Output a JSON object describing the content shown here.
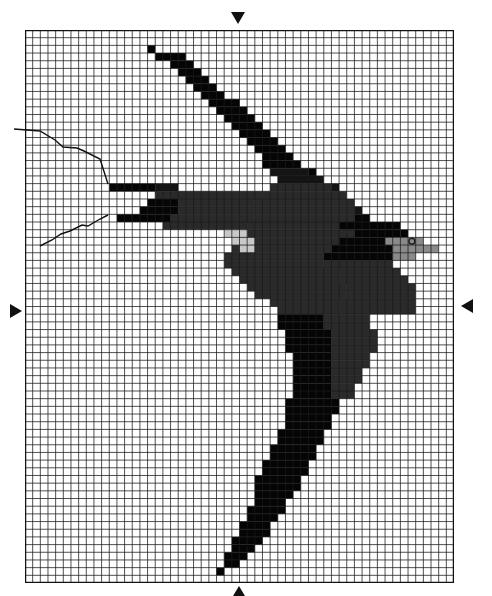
{
  "chart_title": "",
  "grid": {
    "cols": 56,
    "rows": 72,
    "left": 25,
    "top": 30,
    "width": 429,
    "height": 553,
    "line_color": "#1a1a1a",
    "background": "#ffffff"
  },
  "palette": {
    "K": "#050505",
    "B": "#141414",
    "D": "#2a2a2a",
    "G": "#8a8a8a",
    "L": "#c8c8c8"
  },
  "center_markers": [
    {
      "position": "top",
      "glyph": "▼"
    },
    {
      "position": "bottom",
      "glyph": "▲"
    },
    {
      "position": "left",
      "glyph": "▶"
    },
    {
      "position": "right",
      "glyph": "◀"
    }
  ],
  "eye": {
    "col": 50,
    "row": 27,
    "color": "#111111"
  },
  "tail_streamers": [
    [
      [
        14,
        129
      ],
      [
        40,
        131
      ],
      [
        55,
        140
      ],
      [
        63,
        147
      ],
      [
        77,
        148
      ],
      [
        84,
        151
      ],
      [
        100,
        159
      ],
      [
        108,
        184
      ]
    ],
    [
      [
        108,
        215
      ],
      [
        100,
        219
      ],
      [
        88,
        226
      ],
      [
        82,
        225
      ],
      [
        70,
        231
      ],
      [
        61,
        234
      ],
      [
        52,
        240
      ],
      [
        40,
        246
      ]
    ]
  ],
  "stitches": [
    {
      "row": 2,
      "runs": [
        [
          16,
          16,
          "K"
        ]
      ]
    },
    {
      "row": 3,
      "runs": [
        [
          17,
          20,
          "K"
        ]
      ]
    },
    {
      "row": 4,
      "runs": [
        [
          19,
          21,
          "K"
        ]
      ]
    },
    {
      "row": 5,
      "runs": [
        [
          20,
          22,
          "K"
        ]
      ]
    },
    {
      "row": 6,
      "runs": [
        [
          21,
          23,
          "K"
        ]
      ]
    },
    {
      "row": 7,
      "runs": [
        [
          22,
          24,
          "K"
        ]
      ]
    },
    {
      "row": 8,
      "runs": [
        [
          23,
          25,
          "K"
        ]
      ]
    },
    {
      "row": 9,
      "runs": [
        [
          24,
          27,
          "K"
        ]
      ]
    },
    {
      "row": 10,
      "runs": [
        [
          25,
          28,
          "K"
        ]
      ]
    },
    {
      "row": 11,
      "runs": [
        [
          26,
          29,
          "K"
        ]
      ]
    },
    {
      "row": 12,
      "runs": [
        [
          27,
          30,
          "K"
        ]
      ]
    },
    {
      "row": 13,
      "runs": [
        [
          28,
          31,
          "K"
        ]
      ]
    },
    {
      "row": 14,
      "runs": [
        [
          29,
          32,
          "K"
        ]
      ]
    },
    {
      "row": 15,
      "runs": [
        [
          30,
          33,
          "K"
        ]
      ]
    },
    {
      "row": 16,
      "runs": [
        [
          31,
          34,
          "K"
        ]
      ]
    },
    {
      "row": 17,
      "runs": [
        [
          31,
          35,
          "K"
        ]
      ]
    },
    {
      "row": 18,
      "runs": [
        [
          32,
          36,
          "B"
        ],
        [
          37,
          37,
          "K"
        ]
      ]
    },
    {
      "row": 19,
      "runs": [
        [
          33,
          38,
          "B"
        ]
      ]
    },
    {
      "row": 20,
      "runs": [
        [
          32,
          39,
          "D"
        ],
        [
          40,
          40,
          "B"
        ]
      ]
    },
    {
      "row": 21,
      "runs": [
        [
          31,
          41,
          "D"
        ]
      ]
    },
    {
      "row": 22,
      "runs": [
        [
          30,
          42,
          "D"
        ]
      ]
    },
    {
      "row": 23,
      "runs": [
        [
          30,
          42,
          "D"
        ],
        [
          43,
          43,
          "B"
        ]
      ]
    },
    {
      "row": 24,
      "runs": [
        [
          30,
          42,
          "D"
        ],
        [
          43,
          44,
          "K"
        ]
      ]
    },
    {
      "row": 25,
      "runs": [
        [
          29,
          40,
          "D"
        ],
        [
          41,
          46,
          "K"
        ],
        [
          47,
          48,
          "K"
        ]
      ]
    },
    {
      "row": 26,
      "runs": [
        [
          29,
          42,
          "D"
        ],
        [
          43,
          48,
          "K"
        ],
        [
          49,
          49,
          "K"
        ]
      ]
    },
    {
      "row": 27,
      "runs": [
        [
          28,
          40,
          "D"
        ],
        [
          41,
          46,
          "K"
        ],
        [
          47,
          51,
          "G"
        ]
      ]
    },
    {
      "row": 28,
      "runs": [
        [
          27,
          39,
          "D"
        ],
        [
          40,
          47,
          "K"
        ],
        [
          48,
          53,
          "G"
        ]
      ]
    },
    {
      "row": 29,
      "runs": [
        [
          26,
          38,
          "D"
        ],
        [
          39,
          47,
          "K"
        ],
        [
          48,
          50,
          "G"
        ]
      ]
    },
    {
      "row": 30,
      "runs": [
        [
          26,
          38,
          "D"
        ],
        [
          39,
          47,
          "D"
        ]
      ]
    },
    {
      "row": 31,
      "runs": [
        [
          27,
          40,
          "D"
        ],
        [
          41,
          48,
          "D"
        ]
      ]
    },
    {
      "row": 32,
      "runs": [
        [
          28,
          40,
          "D"
        ],
        [
          41,
          49,
          "D"
        ]
      ]
    },
    {
      "row": 33,
      "runs": [
        [
          29,
          41,
          "D"
        ],
        [
          42,
          50,
          "D"
        ]
      ]
    },
    {
      "row": 34,
      "runs": [
        [
          30,
          41,
          "D"
        ],
        [
          42,
          50,
          "D"
        ]
      ]
    },
    {
      "row": 35,
      "runs": [
        [
          32,
          40,
          "D"
        ],
        [
          41,
          50,
          "D"
        ]
      ]
    },
    {
      "row": 36,
      "runs": [
        [
          33,
          40,
          "D"
        ],
        [
          41,
          50,
          "D"
        ]
      ]
    },
    {
      "row": 37,
      "runs": [
        [
          33,
          38,
          "K"
        ],
        [
          39,
          44,
          "D"
        ]
      ]
    },
    {
      "row": 38,
      "runs": [
        [
          33,
          38,
          "K"
        ],
        [
          39,
          44,
          "D"
        ]
      ]
    },
    {
      "row": 39,
      "runs": [
        [
          34,
          39,
          "K"
        ],
        [
          40,
          45,
          "D"
        ]
      ]
    },
    {
      "row": 40,
      "runs": [
        [
          34,
          39,
          "K"
        ],
        [
          40,
          45,
          "D"
        ]
      ]
    },
    {
      "row": 41,
      "runs": [
        [
          34,
          39,
          "K"
        ],
        [
          40,
          45,
          "D"
        ]
      ]
    },
    {
      "row": 42,
      "runs": [
        [
          35,
          39,
          "K"
        ],
        [
          40,
          44,
          "D"
        ]
      ]
    },
    {
      "row": 43,
      "runs": [
        [
          35,
          39,
          "K"
        ],
        [
          40,
          44,
          "D"
        ]
      ]
    },
    {
      "row": 44,
      "runs": [
        [
          35,
          39,
          "K"
        ],
        [
          40,
          43,
          "D"
        ]
      ]
    },
    {
      "row": 45,
      "runs": [
        [
          35,
          39,
          "K"
        ],
        [
          40,
          43,
          "D"
        ]
      ]
    },
    {
      "row": 46,
      "runs": [
        [
          35,
          39,
          "K"
        ],
        [
          40,
          42,
          "D"
        ]
      ]
    },
    {
      "row": 47,
      "runs": [
        [
          35,
          39,
          "K"
        ],
        [
          40,
          42,
          "D"
        ]
      ]
    },
    {
      "row": 48,
      "runs": [
        [
          34,
          40,
          "K"
        ]
      ]
    },
    {
      "row": 49,
      "runs": [
        [
          34,
          40,
          "K"
        ]
      ]
    },
    {
      "row": 50,
      "runs": [
        [
          34,
          39,
          "K"
        ]
      ]
    },
    {
      "row": 51,
      "runs": [
        [
          34,
          39,
          "K"
        ]
      ]
    },
    {
      "row": 52,
      "runs": [
        [
          33,
          38,
          "K"
        ]
      ]
    },
    {
      "row": 53,
      "runs": [
        [
          33,
          38,
          "K"
        ]
      ]
    },
    {
      "row": 54,
      "runs": [
        [
          32,
          37,
          "K"
        ]
      ]
    },
    {
      "row": 55,
      "runs": [
        [
          32,
          37,
          "K"
        ]
      ]
    },
    {
      "row": 56,
      "runs": [
        [
          31,
          36,
          "K"
        ]
      ]
    },
    {
      "row": 57,
      "runs": [
        [
          31,
          36,
          "K"
        ]
      ]
    },
    {
      "row": 58,
      "runs": [
        [
          30,
          35,
          "K"
        ]
      ]
    },
    {
      "row": 59,
      "runs": [
        [
          30,
          35,
          "K"
        ]
      ]
    },
    {
      "row": 60,
      "runs": [
        [
          30,
          34,
          "K"
        ]
      ]
    },
    {
      "row": 61,
      "runs": [
        [
          30,
          33,
          "K"
        ]
      ]
    },
    {
      "row": 62,
      "runs": [
        [
          29,
          33,
          "K"
        ]
      ]
    },
    {
      "row": 63,
      "runs": [
        [
          29,
          32,
          "K"
        ]
      ]
    },
    {
      "row": 64,
      "runs": [
        [
          28,
          31,
          "K"
        ]
      ]
    },
    {
      "row": 65,
      "runs": [
        [
          28,
          31,
          "K"
        ]
      ]
    },
    {
      "row": 66,
      "runs": [
        [
          27,
          30,
          "K"
        ]
      ]
    },
    {
      "row": 67,
      "runs": [
        [
          27,
          29,
          "K"
        ]
      ]
    },
    {
      "row": 68,
      "runs": [
        [
          26,
          28,
          "K"
        ]
      ]
    },
    {
      "row": 69,
      "runs": [
        [
          26,
          27,
          "K"
        ]
      ]
    },
    {
      "row": 70,
      "runs": [
        [
          25,
          25,
          "K"
        ]
      ]
    },
    {
      "row": 20,
      "runs": [
        [
          11,
          16,
          "K"
        ],
        [
          17,
          19,
          "B"
        ]
      ]
    },
    {
      "row": 21,
      "runs": [
        [
          17,
          30,
          "D"
        ]
      ]
    },
    {
      "row": 22,
      "runs": [
        [
          16,
          19,
          "K"
        ],
        [
          20,
          29,
          "D"
        ]
      ]
    },
    {
      "row": 23,
      "runs": [
        [
          15,
          19,
          "K"
        ],
        [
          20,
          29,
          "D"
        ]
      ]
    },
    {
      "row": 24,
      "runs": [
        [
          12,
          18,
          "K"
        ],
        [
          19,
          29,
          "D"
        ]
      ]
    },
    {
      "row": 25,
      "runs": [
        [
          18,
          28,
          "D"
        ]
      ]
    },
    {
      "row": 26,
      "runs": [
        [
          26,
          28,
          "L"
        ]
      ]
    },
    {
      "row": 27,
      "runs": [
        [
          27,
          29,
          "L"
        ]
      ]
    },
    {
      "row": 28,
      "runs": [
        [
          28,
          29,
          "L"
        ]
      ]
    }
  ]
}
